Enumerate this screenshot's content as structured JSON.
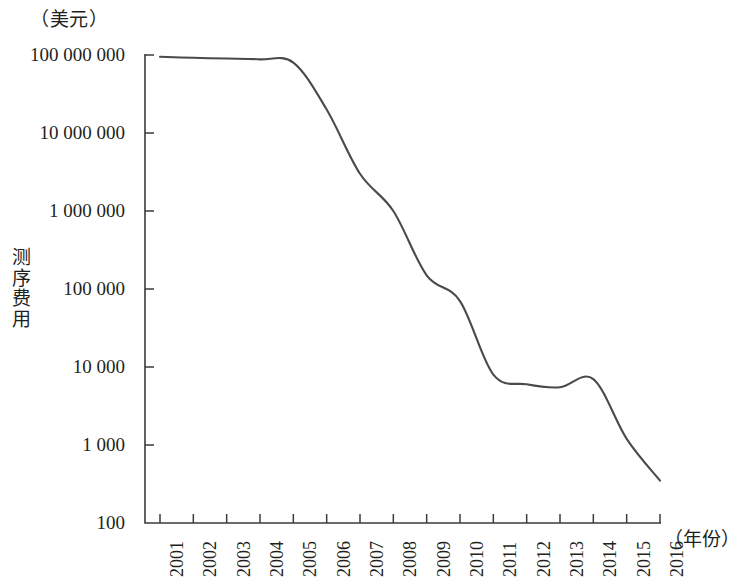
{
  "chart_data": {
    "type": "line",
    "title": "",
    "unit_label": "（美元）",
    "ylabel": "测序费用",
    "xlabel": "（年份）",
    "x": [
      2001,
      2002,
      2003,
      2004,
      2005,
      2006,
      2007,
      2008,
      2009,
      2010,
      2011,
      2012,
      2013,
      2014,
      2015,
      2016
    ],
    "categories": [
      "2001",
      "2002",
      "2003",
      "2004",
      "2005",
      "2006",
      "2007",
      "2008",
      "2009",
      "2010",
      "2011",
      "2012",
      "2013",
      "2014",
      "2015",
      "2016"
    ],
    "values": [
      95000000,
      92000000,
      90000000,
      88000000,
      80000000,
      20000000,
      3000000,
      1000000,
      150000,
      70000,
      8000,
      6000,
      5500,
      7000,
      1200,
      350
    ],
    "series": [
      {
        "name": "测序费用",
        "values": [
          95000000,
          92000000,
          90000000,
          88000000,
          80000000,
          20000000,
          3000000,
          1000000,
          150000,
          70000,
          8000,
          6000,
          5500,
          7000,
          1200,
          350
        ]
      }
    ],
    "yscale": "log",
    "ylim": [
      100,
      100000000
    ],
    "xlim": [
      2001,
      2016
    ],
    "ytick_labels": [
      "100 000 000",
      "10 000 000",
      "1 000 000",
      "100 000",
      "10 000",
      "1 000",
      "100"
    ],
    "ytick_values": [
      100000000,
      10000000,
      1000000,
      100000,
      10000,
      1000,
      100
    ],
    "grid": false,
    "legend": false,
    "line_color": "#4a4a4a",
    "axis_color": "#3b3b3b"
  },
  "axes": {
    "unit_label": "（美元）",
    "y_axis_title": "测序费用",
    "x_axis_unit": "（年份）",
    "y_ticks": [
      {
        "label": "100 000 000",
        "value": 100000000
      },
      {
        "label": "10 000 000",
        "value": 10000000
      },
      {
        "label": "1 000 000",
        "value": 1000000
      },
      {
        "label": "100 000",
        "value": 100000
      },
      {
        "label": "10 000",
        "value": 10000
      },
      {
        "label": "1 000",
        "value": 1000
      },
      {
        "label": "100",
        "value": 100
      }
    ],
    "x_ticks": [
      {
        "label": "2001"
      },
      {
        "label": "2002"
      },
      {
        "label": "2003"
      },
      {
        "label": "2004"
      },
      {
        "label": "2005"
      },
      {
        "label": "2006"
      },
      {
        "label": "2007"
      },
      {
        "label": "2008"
      },
      {
        "label": "2009"
      },
      {
        "label": "2010"
      },
      {
        "label": "2011"
      },
      {
        "label": "2012"
      },
      {
        "label": "2013"
      },
      {
        "label": "2014"
      },
      {
        "label": "2015"
      },
      {
        "label": "2016"
      }
    ]
  }
}
